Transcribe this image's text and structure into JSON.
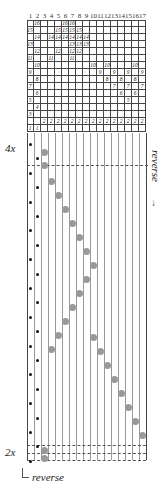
{
  "diagram": {
    "column_headers": [
      "1",
      "2",
      "3",
      "4",
      "5",
      "6",
      "7",
      "8",
      "9",
      "10",
      "11",
      "12",
      "13",
      "14",
      "15",
      "16",
      "17"
    ],
    "grid_rows": [
      {
        "row": 16,
        "cells": {
          "2": "16",
          "6": "16",
          "7": "16"
        }
      },
      {
        "row": 15,
        "cells": {
          "1": "15",
          "5": "15",
          "6": "15",
          "7": "15",
          "8": "15"
        }
      },
      {
        "row": 14,
        "cells": {
          "2": "14",
          "4": "14",
          "5": "14",
          "6": "14",
          "7": "14",
          "8": "14",
          "9": "14"
        }
      },
      {
        "row": 13,
        "cells": {
          "1": "13",
          "7": "13",
          "8": "13",
          "9": "13"
        }
      },
      {
        "row": 12,
        "cells": {
          "2": "12",
          "5": "12",
          "7": "12",
          "8": "12"
        }
      },
      {
        "row": 11,
        "cells": {
          "1": "11",
          "4": "11",
          "7": "11"
        }
      },
      {
        "row": 10,
        "cells": {
          "2": "10",
          "10": "10",
          "12": "10",
          "16": "10"
        }
      },
      {
        "row": 9,
        "cells": {
          "1": "9",
          "11": "9",
          "13": "9",
          "15": "9",
          "17": "9"
        }
      },
      {
        "row": 8,
        "cells": {
          "2": "8",
          "12": "8",
          "14": "8",
          "16": "8"
        }
      },
      {
        "row": 7,
        "cells": {
          "1": "7",
          "13": "7",
          "15": "7",
          "17": "7"
        }
      },
      {
        "row": 6,
        "cells": {
          "2": "6",
          "14": "6",
          "16": "6"
        }
      },
      {
        "row": 5,
        "cells": {
          "1": "5",
          "15": "5"
        }
      },
      {
        "row": 4,
        "cells": {
          "2": "4"
        }
      },
      {
        "row": 3,
        "cells": {
          "1": "3"
        }
      },
      {
        "row": 2,
        "cells": {
          "3": "2",
          "4": "2",
          "5": "2",
          "6": "2",
          "7": "2",
          "8": "2",
          "9": "2",
          "10": "2",
          "11": "2",
          "12": "2",
          "13": "2",
          "14": "2",
          "15": "2",
          "16": "2",
          "17": "2"
        }
      },
      {
        "row": 1,
        "cells": {
          "1": "1",
          "2": "1"
        }
      }
    ],
    "labels": {
      "repeat_top": "4x",
      "repeat_bottom": "2x",
      "reverse_right": "reverse",
      "reverse_bottom": "reverse",
      "arrow_down": "↓",
      "arrow_up": "↑"
    }
  }
}
